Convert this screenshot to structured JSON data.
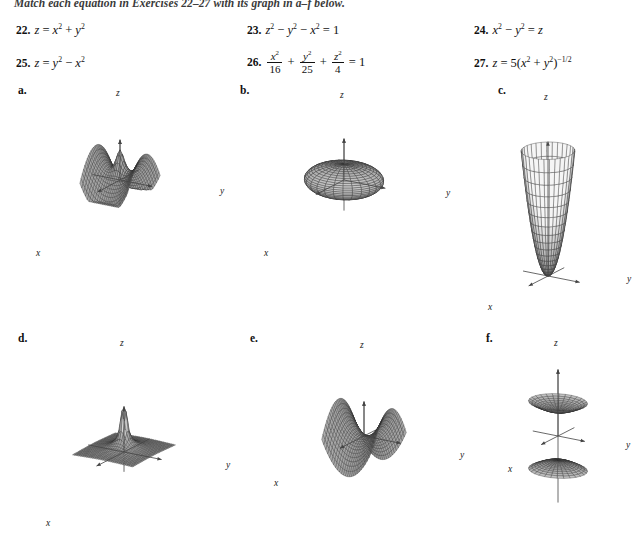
{
  "instruction": "Match each equation in Exercises 22–27 with its graph in a–f below.",
  "exercises": [
    {
      "number": "22.",
      "equation_text": "z = x² + y²"
    },
    {
      "number": "23.",
      "equation_text": "z² − y² − x² = 1"
    },
    {
      "number": "24.",
      "equation_text": "x² − y² = z"
    },
    {
      "number": "25.",
      "equation_text": "z = y² − x²"
    },
    {
      "number": "26.",
      "equation_text": "x²/16 + y²/25 + z²/4 = 1"
    },
    {
      "number": "27.",
      "equation_text": "z = 5(x² + y²)⁻¹ᐟ²"
    }
  ],
  "equation_parts": {
    "e22": {
      "lhs": "z",
      "eq": "=",
      "t1": "x",
      "p1": "2",
      "op": "+",
      "t2": "y",
      "p2": "2"
    },
    "e23": {
      "t1": "z",
      "p1": "2",
      "op1": "−",
      "t2": "y",
      "p2": "2",
      "op2": "−",
      "t3": "x",
      "p3": "2",
      "eq": "=",
      "rhs": "1"
    },
    "e24": {
      "t1": "x",
      "p1": "2",
      "op": "−",
      "t2": "y",
      "p2": "2",
      "eq": "=",
      "rhs": "z"
    },
    "e25": {
      "lhs": "z",
      "eq": "=",
      "t1": "y",
      "p1": "2",
      "op": "−",
      "t2": "x",
      "p2": "2"
    },
    "e26": {
      "n1": "x",
      "n1p": "2",
      "d1": "16",
      "op1": "+",
      "n2": "y",
      "n2p": "2",
      "d2": "25",
      "op2": "+",
      "n3": "z",
      "n3p": "2",
      "d3": "4",
      "eq": "=",
      "rhs": "1"
    },
    "e27": {
      "lhs": "z",
      "eq": "=",
      "coef": "5",
      "po": "(",
      "t1": "x",
      "p1": "2",
      "op": "+",
      "t2": "y",
      "p2": "2",
      "pc": ")",
      "exp": "−1/2"
    }
  },
  "figures": [
    {
      "letter": "a.",
      "surface_name": "hyperbolic-paraboloid-rotated",
      "caption_axes": {
        "x": "x",
        "y": "y",
        "z": "z"
      }
    },
    {
      "letter": "b.",
      "surface_name": "ellipsoid",
      "caption_axes": {
        "x": "x",
        "y": "y",
        "z": "z"
      }
    },
    {
      "letter": "c.",
      "surface_name": "circular-paraboloid",
      "caption_axes": {
        "x": "x",
        "y": "y",
        "z": "z"
      }
    },
    {
      "letter": "d.",
      "surface_name": "inverse-radius-spike",
      "caption_axes": {
        "x": "x",
        "y": "y",
        "z": "z"
      }
    },
    {
      "letter": "e.",
      "surface_name": "saddle",
      "caption_axes": {
        "x": "x",
        "y": "y",
        "z": "z"
      }
    },
    {
      "letter": "f.",
      "surface_name": "hyperboloid-two-sheets",
      "caption_axes": {
        "x": "x",
        "y": "y",
        "z": "z"
      }
    }
  ],
  "colors": {
    "ink": "#111111",
    "mesh": "#2b2b2b",
    "axis": "#444444",
    "fill_light": "#e8e8e8",
    "fill_mid": "#c9c9c9",
    "fill_dark": "#9a9a9a",
    "page": "#ffffff"
  }
}
